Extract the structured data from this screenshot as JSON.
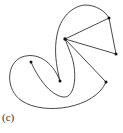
{
  "figure": {
    "label": "(c)",
    "stroke_color": "#333333",
    "point_color": "#111111",
    "points": {
      "A": [
        31,
        62
      ],
      "B": [
        60,
        81
      ],
      "C": [
        65,
        39
      ],
      "D": [
        109,
        18
      ],
      "E": [
        116,
        54
      ],
      "F": [
        106,
        82
      ]
    },
    "straight_segments": [
      [
        "C",
        "D"
      ],
      [
        "D",
        "E"
      ],
      [
        "E",
        "C"
      ],
      [
        "C",
        "F"
      ]
    ]
  }
}
